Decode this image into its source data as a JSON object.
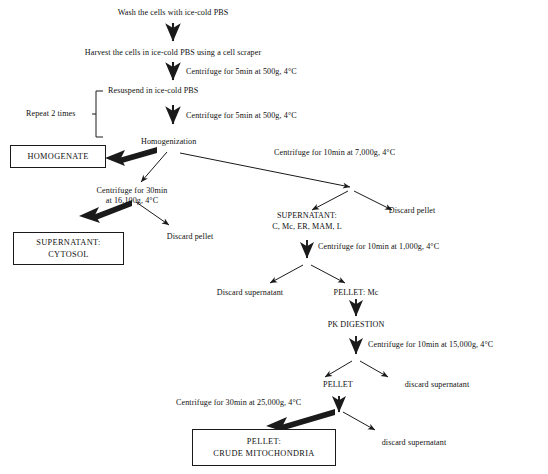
{
  "diagram": {
    "background_color": "#ffffff",
    "line_color": "#1a1a1a",
    "text_color": "#101010"
  },
  "steps": {
    "wash": "Wash the cells with ice-cold PBS",
    "harvest": "Harvest the cells in ice-cold PBS using a cell scraper",
    "spin500_a": "Centrifuge for 5min at 500g, 4°C",
    "resuspend": "Resuspend in ice-cold PBS",
    "spin500_b": "Centrifuge for 5min at 500g, 4°C",
    "repeat": "Repeat 2 times",
    "homogenization": "Homogenization",
    "spin16100": "Centrifuge for 30min",
    "spin16100_b": "at 16,100g, 4°C",
    "spin7000": "Centrifuge for 10min at 7,000g, 4°C",
    "spin1000": "Centrifuge for 10min at 1,000g, 4°C",
    "spin15000": "Centrifuge for 10min at 15,000g, 4°C",
    "spin25000": "Centrifuge for 30min at 25,000g, 4°C",
    "discard_pellet_left": "Discard pellet",
    "discard_pellet_right": "Discard pellet",
    "supernatant_mix_l1": "SUPERNATANT:",
    "supernatant_mix_l2": "C, Mc, ER, MAM, L",
    "discard_supernatant_1": "Discard supernatant",
    "pellet_mc": "PELLET: Mc",
    "pk_digestion": "PK DIGESTION",
    "pellet": "PELLET",
    "discard_supernatant_2": "discard supernatant",
    "discard_supernatant_3": "discard supernatant"
  },
  "boxes": {
    "homogenate": "HOMOGENATE",
    "cytosol_l1": "SUPERNATANT:",
    "cytosol_l2": "CYTOSOL",
    "crude_mito_l1": "PELLET:",
    "crude_mito_l2": "CRUDE MITOCHONDRIA"
  }
}
